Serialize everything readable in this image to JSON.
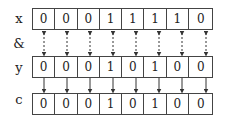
{
  "diagram": {
    "rows": [
      {
        "label": "x",
        "bits": [
          "0",
          "0",
          "0",
          "1",
          "1",
          "1",
          "1",
          "0"
        ]
      },
      {
        "label": "y",
        "bits": [
          "0",
          "0",
          "0",
          "1",
          "0",
          "1",
          "0",
          "0"
        ]
      },
      {
        "label": "c",
        "bits": [
          "0",
          "0",
          "0",
          "1",
          "0",
          "1",
          "0",
          "0"
        ]
      }
    ],
    "operator": "&",
    "connectors": {
      "x_to_y": "dashed double-headed arrows",
      "y_to_c": "solid down arrows"
    }
  }
}
